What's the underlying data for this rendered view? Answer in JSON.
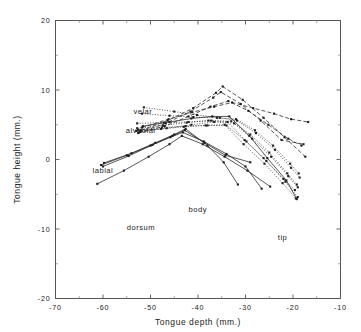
{
  "figure": {
    "background": "#ffffff",
    "ink_color": "#2b2b2b"
  },
  "chart_data": {
    "type": "line",
    "title": "",
    "subtitle": "",
    "xlabel": "Tongue depth (mm.)",
    "ylabel": "Tongue height (mm.)",
    "xlim": [
      -70,
      -10
    ],
    "ylim": [
      -20,
      20
    ],
    "xticks": [
      -70,
      -60,
      -50,
      -40,
      -30,
      -20,
      -10
    ],
    "yticks": [
      -20,
      -10,
      0,
      10,
      20
    ],
    "xtick_labels": [
      "-70",
      "-60",
      "-50",
      "-40",
      "-30",
      "-20",
      "-10"
    ],
    "ytick_labels": [
      "-20",
      "-10",
      "0",
      "10",
      "20"
    ],
    "xminor_ticks": [
      -65,
      -55,
      -45,
      -35,
      -25,
      -15
    ],
    "yminor_ticks": [
      -15,
      -5,
      5,
      15
    ],
    "grid": false,
    "legend": "none",
    "marker": "square",
    "annotations": [
      {
        "text": "velar",
        "x": -53.6,
        "y": 6.6
      },
      {
        "text": "alveolar",
        "x": -55.2,
        "y": 3.8
      },
      {
        "text": "labial",
        "x": -62.2,
        "y": -1.9
      },
      {
        "text": "dorsum",
        "x": -55.0,
        "y": -10.2
      },
      {
        "text": "body",
        "x": -42.0,
        "y": -7.6
      },
      {
        "text": "tip",
        "x": -23.2,
        "y": -11.6
      }
    ],
    "series": [
      {
        "name": "velar-dotted-1",
        "style": "dotted",
        "x": [
          -51.4,
          -45.0,
          -40.2,
          -35.4,
          -31.8,
          -27.8,
          -23.8,
          -20.4,
          -18.6
        ],
        "y": [
          7.5,
          6.9,
          6.4,
          6.0,
          5.6,
          3.8,
          1.4,
          -1.2,
          -2.6
        ]
      },
      {
        "name": "velar-dotted-2",
        "style": "dotted",
        "x": [
          -51.8,
          -46.0,
          -41.0,
          -36.0,
          -32.0,
          -28.0,
          -24.2,
          -20.6,
          -18.8
        ],
        "y": [
          6.6,
          6.3,
          6.1,
          6.0,
          5.8,
          4.2,
          2.0,
          -0.6,
          -2.0
        ]
      },
      {
        "name": "velar-dotted-3",
        "style": "dotted",
        "x": [
          -52.8,
          -47.2,
          -42.0,
          -37.2,
          -33.0,
          -29.0,
          -25.0,
          -21.2,
          -19.2
        ],
        "y": [
          5.2,
          5.3,
          5.4,
          5.6,
          5.5,
          3.6,
          1.0,
          -2.0,
          -3.6
        ]
      },
      {
        "name": "alveolar-dotted-4",
        "style": "dotted",
        "x": [
          -52.6,
          -47.6,
          -42.6,
          -38.0,
          -34.0,
          -30.2,
          -26.2,
          -22.0,
          -19.6
        ],
        "y": [
          4.3,
          4.6,
          4.8,
          4.9,
          4.9,
          2.8,
          0.2,
          -2.8,
          -4.4
        ]
      },
      {
        "name": "alveolar-dotted-5",
        "style": "dotted",
        "x": [
          -52.2,
          -46.6,
          -41.4,
          -36.6,
          -32.4,
          -28.6,
          -24.6,
          -21.0,
          -19.0
        ],
        "y": [
          4.0,
          4.5,
          5.0,
          5.4,
          5.2,
          3.0,
          0.4,
          -2.4,
          -4.0
        ]
      },
      {
        "name": "body-dashed-1",
        "style": "dashed",
        "x": [
          -52.0,
          -46.4,
          -41.0,
          -36.2,
          -34.8,
          -30.6,
          -26.2,
          -21.8,
          -17.4
        ],
        "y": [
          4.2,
          5.6,
          7.4,
          9.6,
          10.5,
          8.6,
          6.0,
          3.2,
          0.4
        ]
      },
      {
        "name": "body-dashed-2",
        "style": "dashed",
        "x": [
          -52.4,
          -46.8,
          -41.6,
          -36.8,
          -35.2,
          -31.0,
          -26.8,
          -22.4,
          -17.8
        ],
        "y": [
          3.9,
          5.2,
          6.9,
          8.9,
          9.7,
          8.0,
          5.6,
          2.8,
          2.2
        ]
      },
      {
        "name": "body-dashed-3",
        "style": "dashed",
        "x": [
          -52.6,
          -47.0,
          -42.0,
          -37.4,
          -33.6,
          -29.4,
          -25.2,
          -21.0,
          -18.2
        ],
        "y": [
          3.8,
          4.8,
          6.2,
          7.6,
          8.4,
          7.0,
          5.0,
          3.0,
          2.0
        ]
      },
      {
        "name": "body-dashed-4",
        "style": "dashed",
        "x": [
          -51.8,
          -46.2,
          -41.2,
          -36.6,
          -32.8,
          -28.4,
          -24.0,
          -20.4,
          -16.8
        ],
        "y": [
          4.6,
          5.8,
          6.8,
          7.6,
          8.2,
          7.4,
          6.6,
          5.8,
          5.4
        ]
      },
      {
        "name": "labial-solid-1",
        "style": "solid",
        "x": [
          -59.8,
          -54.0,
          -49.0,
          -45.0,
          -42.6,
          -38.0,
          -34.6,
          -31.6
        ],
        "y": [
          -0.5,
          0.9,
          2.4,
          3.6,
          4.4,
          2.0,
          -0.4,
          -3.6
        ]
      },
      {
        "name": "labial-solid-2",
        "style": "solid",
        "x": [
          -60.0,
          -54.6,
          -49.6,
          -45.4,
          -42.8,
          -38.6,
          -34.2,
          -29.0
        ],
        "y": [
          -1.0,
          0.5,
          2.1,
          3.4,
          4.2,
          2.4,
          0.6,
          -0.4
        ]
      },
      {
        "name": "labial-solid-3",
        "style": "solid",
        "x": [
          -60.4,
          -55.0,
          -50.0,
          -45.8,
          -43.2,
          -38.8,
          -34.0,
          -30.0,
          -26.6
        ],
        "y": [
          -0.8,
          0.6,
          2.0,
          3.2,
          3.9,
          2.6,
          0.8,
          -1.0,
          -4.2
        ]
      },
      {
        "name": "labial-solid-4",
        "style": "solid",
        "x": [
          -61.2,
          -55.6,
          -50.4,
          -46.0,
          -43.4,
          -39.0,
          -34.4,
          -29.6,
          -24.8
        ],
        "y": [
          -3.5,
          -1.6,
          0.4,
          2.2,
          3.4,
          2.2,
          0.4,
          -1.6,
          -3.9
        ]
      },
      {
        "name": "tip-dotted-6",
        "style": "dotted",
        "x": [
          -53.0,
          -47.8,
          -43.0,
          -38.4,
          -34.4,
          -30.4,
          -26.0,
          -22.2,
          -19.4
        ],
        "y": [
          4.1,
          4.4,
          4.7,
          4.9,
          5.0,
          2.2,
          -0.6,
          -3.4,
          -5.6
        ]
      },
      {
        "name": "tip-dotted-7",
        "style": "dotted",
        "x": [
          -52.8,
          -47.4,
          -42.4,
          -37.8,
          -33.8,
          -29.8,
          -25.6,
          -21.6,
          -19.0
        ],
        "y": [
          4.5,
          4.9,
          5.3,
          5.6,
          5.4,
          2.6,
          -0.2,
          -3.2,
          -5.4
        ]
      },
      {
        "name": "tip-solid-5",
        "style": "solid",
        "x": [
          -51.6,
          -46.0,
          -41.4,
          -37.0,
          -33.4,
          -29.2,
          -25.4,
          -21.4,
          -19.2
        ],
        "y": [
          4.8,
          5.4,
          5.9,
          6.2,
          6.2,
          3.4,
          0.2,
          -3.0,
          -5.7
        ]
      }
    ]
  }
}
